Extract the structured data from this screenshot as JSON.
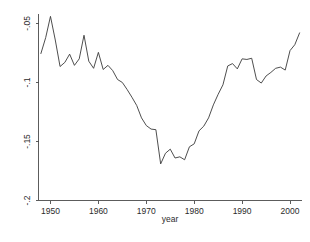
{
  "figure": {
    "background": "#ffffff",
    "line_color": "#3a3a3a",
    "axis_color": "#4a4a4a"
  },
  "axes": {
    "x_title": "year",
    "y_title": "",
    "x_ticks": [
      "1950",
      "1960",
      "1970",
      "1980",
      "1990",
      "2000"
    ],
    "y_ticks": [
      "-.05",
      "-.1",
      "-.15",
      "-.2"
    ]
  },
  "chart_data": {
    "type": "line",
    "title": "",
    "subtitle": "",
    "xlabel": "year",
    "ylabel": "",
    "xlim": [
      1947.5,
      2002.5
    ],
    "ylim": [
      -0.2,
      -0.042
    ],
    "grid": false,
    "legend": null,
    "xticks": [
      1950,
      1960,
      1970,
      1980,
      1990,
      2000
    ],
    "yticks": [
      -0.05,
      -0.1,
      -0.15,
      -0.2
    ],
    "xtick_labels": [
      "1950",
      "1960",
      "1970",
      "1980",
      "1990",
      "2000"
    ],
    "ytick_labels": [
      "-.05",
      "-.1",
      "-.15",
      "-.2"
    ],
    "x": [
      1948,
      1949,
      1950,
      1951,
      1952,
      1953,
      1954,
      1955,
      1956,
      1957,
      1958,
      1959,
      1960,
      1961,
      1962,
      1963,
      1964,
      1965,
      1966,
      1967,
      1968,
      1969,
      1970,
      1971,
      1972,
      1973,
      1974,
      1975,
      1976,
      1977,
      1978,
      1979,
      1980,
      1981,
      1982,
      1983,
      1984,
      1985,
      1986,
      1987,
      1988,
      1989,
      1990,
      1991,
      1992,
      1993,
      1994,
      1995,
      1996,
      1997,
      1998,
      1999,
      2000,
      2001,
      2002
    ],
    "values": [
      -0.0755,
      -0.062,
      -0.044,
      -0.064,
      -0.0865,
      -0.083,
      -0.076,
      -0.0855,
      -0.08,
      -0.06,
      -0.082,
      -0.088,
      -0.0745,
      -0.089,
      -0.0855,
      -0.09,
      -0.0975,
      -0.1,
      -0.106,
      -0.1125,
      -0.1195,
      -0.13,
      -0.1365,
      -0.1395,
      -0.14,
      -0.169,
      -0.16,
      -0.1565,
      -0.164,
      -0.163,
      -0.1655,
      -0.1545,
      -0.152,
      -0.141,
      -0.137,
      -0.13,
      -0.119,
      -0.11,
      -0.102,
      -0.086,
      -0.084,
      -0.0885,
      -0.08,
      -0.0805,
      -0.0795,
      -0.0975,
      -0.1005,
      -0.0945,
      -0.0915,
      -0.088,
      -0.087,
      -0.0895,
      -0.073,
      -0.068,
      -0.058
    ],
    "series": [
      {
        "name": "series-1",
        "values": [
          -0.0755,
          -0.062,
          -0.044,
          -0.064,
          -0.0865,
          -0.083,
          -0.076,
          -0.0855,
          -0.08,
          -0.06,
          -0.082,
          -0.088,
          -0.0745,
          -0.089,
          -0.0855,
          -0.09,
          -0.0975,
          -0.1,
          -0.106,
          -0.1125,
          -0.1195,
          -0.13,
          -0.1365,
          -0.1395,
          -0.14,
          -0.169,
          -0.16,
          -0.1565,
          -0.164,
          -0.163,
          -0.1655,
          -0.1545,
          -0.152,
          -0.141,
          -0.137,
          -0.13,
          -0.119,
          -0.11,
          -0.102,
          -0.086,
          -0.084,
          -0.0885,
          -0.08,
          -0.0805,
          -0.0795,
          -0.0975,
          -0.1005,
          -0.0945,
          -0.0915,
          -0.088,
          -0.087,
          -0.0895,
          -0.073,
          -0.068,
          -0.058
        ]
      }
    ],
    "annotations": []
  }
}
